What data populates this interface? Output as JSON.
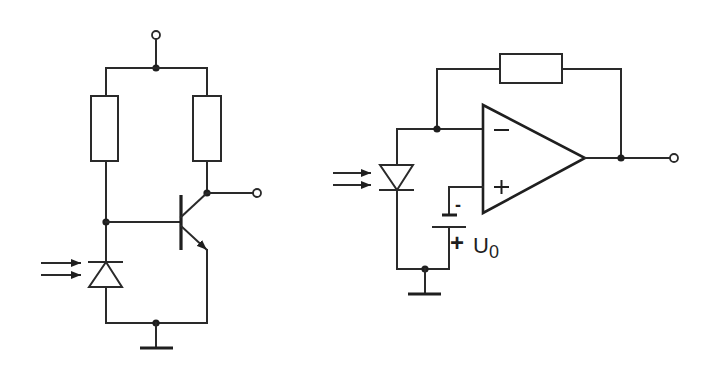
{
  "diagram": {
    "type": "circuit-schematic",
    "circuits": [
      {
        "id": "phototransistor-amplifier",
        "components": [
          "photodiode",
          "resistor",
          "resistor",
          "npn-transistor",
          "ground"
        ],
        "terminals": [
          "supply-input",
          "output"
        ]
      },
      {
        "id": "transimpedance-amplifier",
        "components": [
          "photodiode",
          "op-amp",
          "feedback-resistor",
          "bias-source",
          "ground"
        ],
        "terminals": [
          "output"
        ],
        "opamp_inputs": {
          "inverting": "−",
          "non_inverting": "+"
        },
        "bias_source": {
          "label": "U",
          "subscript": "0",
          "minus_sign": "-",
          "plus_sign": "+"
        }
      }
    ],
    "colors": {
      "line": "#2a2a2a",
      "background": "#ffffff"
    }
  }
}
